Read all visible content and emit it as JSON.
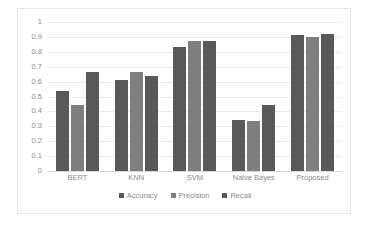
{
  "chart_data": {
    "type": "bar",
    "title": "",
    "xlabel": "",
    "ylabel": "",
    "ylim": [
      0,
      1
    ],
    "y_ticks": [
      "1",
      "0.9",
      "0.8",
      "0.7",
      "0.6",
      "0.5",
      "0.4",
      "0.3",
      "0.2",
      "0.1",
      "0"
    ],
    "y_tick_values": [
      1,
      0.9,
      0.8,
      0.7,
      0.6,
      0.5,
      0.4,
      0.3,
      0.2,
      0.1,
      0
    ],
    "grid": true,
    "legend_position": "bottom",
    "categories": [
      "BERT",
      "KNN",
      "SVM",
      "Naive Bayes",
      "Proposed"
    ],
    "series": [
      {
        "name": "Accuracy",
        "color": "#595959",
        "values": [
          0.54,
          0.61,
          0.83,
          0.345,
          0.91
        ]
      },
      {
        "name": "Precision",
        "color": "#7f7f7f",
        "values": [
          0.445,
          0.665,
          0.875,
          0.335,
          0.9
        ]
      },
      {
        "name": "Recall",
        "color": "#595959",
        "values": [
          0.665,
          0.64,
          0.875,
          0.44,
          0.92
        ]
      }
    ]
  },
  "style": {
    "plot_background": "#ffffff",
    "frame_border": "#e8e8e8",
    "gridline_color": "#ebebeb",
    "baseline_color": "#d9d9d9",
    "tick_label_color": "#8c8c8c"
  }
}
